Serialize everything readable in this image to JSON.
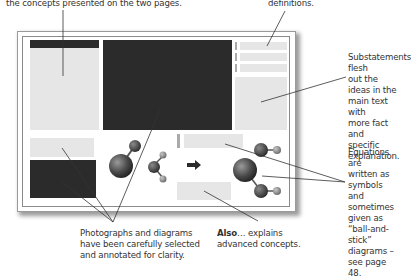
{
  "captions": {
    "top_left": "the concepts presented on the two pages.",
    "top_right": "definitions.",
    "substatements": [
      "Substatements flesh",
      "out the ideas in the",
      "main text with",
      "more fact and",
      "specific explanation."
    ],
    "equations": [
      "Equations are",
      "written as symbols",
      "and sometimes",
      "given as “ball-and-",
      "stick” diagrams –",
      "see page 48."
    ],
    "photographs": [
      "Photographs and diagrams",
      "have been carefully selected",
      "and annotated for clarity."
    ],
    "also_bold": "Also",
    "also_rest": "… explains",
    "also_line2": "advanced concepts."
  },
  "colors": {
    "dark_block": "#2b2b2b",
    "light_block": "#e6e6e6",
    "molecule_large": "#4a4a4a",
    "molecule_small": "#8a8a8a"
  },
  "icons": {
    "arrow": "right-arrow-icon",
    "molecules": [
      "ball-and-stick-molecule",
      "ball-and-stick-molecule"
    ]
  }
}
